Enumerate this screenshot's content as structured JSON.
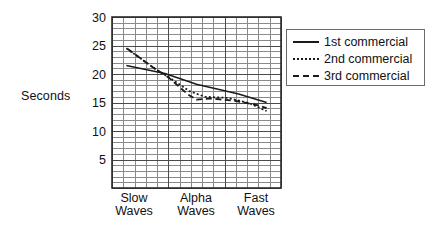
{
  "chart_data": {
    "type": "line",
    "title": "",
    "xlabel": "",
    "ylabel": "Seconds",
    "ylim": [
      0,
      30
    ],
    "yticks": [
      5,
      10,
      15,
      20,
      25,
      30
    ],
    "grid": true,
    "grid_step": 1,
    "legend_position": "right-outside",
    "categories": [
      "Slow Waves",
      "Alpha Waves",
      "Fast Waves"
    ],
    "x": [
      0,
      1,
      2
    ],
    "series": [
      {
        "name": "1st commercial",
        "style": "solid",
        "values": [
          21.5,
          18.2,
          15.0
        ],
        "points": [
          {
            "x": 0.0,
            "y": 21.5
          },
          {
            "x": 0.55,
            "y": 20.1
          },
          {
            "x": 1.0,
            "y": 18.2
          },
          {
            "x": 1.6,
            "y": 16.5
          },
          {
            "x": 2.0,
            "y": 15.0
          }
        ]
      },
      {
        "name": "2nd commercial",
        "style": "dotted",
        "values": [
          24.5,
          16.0,
          13.5
        ],
        "points": [
          {
            "x": 0.0,
            "y": 24.5
          },
          {
            "x": 0.4,
            "y": 21.0
          },
          {
            "x": 0.62,
            "y": 19.3
          },
          {
            "x": 0.9,
            "y": 17.0
          },
          {
            "x": 1.12,
            "y": 16.0
          },
          {
            "x": 1.45,
            "y": 15.8
          },
          {
            "x": 1.75,
            "y": 14.9
          },
          {
            "x": 2.0,
            "y": 13.5
          }
        ]
      },
      {
        "name": "3rd commercial",
        "style": "dashed",
        "values": [
          24.5,
          15.6,
          14.0
        ],
        "points": [
          {
            "x": 0.02,
            "y": 24.4
          },
          {
            "x": 0.35,
            "y": 21.4
          },
          {
            "x": 0.6,
            "y": 19.4
          },
          {
            "x": 0.88,
            "y": 16.4
          },
          {
            "x": 1.0,
            "y": 15.5
          },
          {
            "x": 1.2,
            "y": 15.7
          },
          {
            "x": 1.55,
            "y": 15.3
          },
          {
            "x": 1.85,
            "y": 14.6
          },
          {
            "x": 2.0,
            "y": 14.0
          }
        ]
      }
    ]
  },
  "axes": {
    "y_title": "Seconds",
    "y_tick_labels": [
      "30",
      "25",
      "20",
      "15",
      "10",
      "5"
    ],
    "x_tick_labels": [
      {
        "line1": "Slow",
        "line2": "Waves"
      },
      {
        "line1": "Alpha",
        "line2": "Waves"
      },
      {
        "line1": "Fast",
        "line2": "Waves"
      }
    ]
  },
  "legend": {
    "items": [
      {
        "label": "1st commercial",
        "style": "solid"
      },
      {
        "label": "2nd commercial",
        "style": "dotted"
      },
      {
        "label": "3rd commercial",
        "style": "dashed"
      }
    ]
  },
  "colors": {
    "ink": "#1a1a1a",
    "grid_minor": "#8a8a8a",
    "grid_major": "#4a4a4a",
    "axis": "#2b2b2b",
    "background": "#ffffff"
  }
}
